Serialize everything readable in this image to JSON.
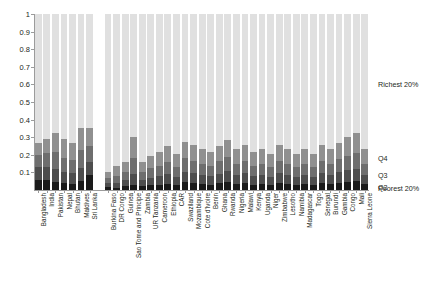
{
  "chart_data": {
    "type": "bar",
    "subtype": "stacked-bar",
    "title": "",
    "xlabel": "",
    "ylabel": "",
    "ylim": [
      0,
      1
    ],
    "ytick_labels": [
      "0",
      "0.1",
      "0.2",
      "0.3",
      "0.4",
      "0.5",
      "0.6",
      "0.7",
      "0.8",
      "0.9",
      "1"
    ],
    "ytick_values": [
      0,
      0.1,
      0.2,
      0.3,
      0.4,
      0.5,
      0.6,
      0.7,
      0.8,
      0.9,
      1
    ],
    "grid": false,
    "legend_position": "right",
    "stack_order_bottom_to_top": [
      "Poorest 20%",
      "Q2",
      "Q3",
      "Q4",
      "Richest 20%"
    ],
    "series": [
      {
        "name": "Poorest 20%",
        "color": "#1a1a1a",
        "values": [
          0.055,
          0.055,
          0.045,
          0.04,
          0.035,
          0.05,
          0.085,
          0.018,
          0.012,
          0.02,
          0.03,
          0.022,
          0.028,
          0.03,
          0.035,
          0.028,
          0.045,
          0.04,
          0.035,
          0.03,
          0.038,
          0.045,
          0.035,
          0.04,
          0.03,
          0.035,
          0.03,
          0.04,
          0.035,
          0.03,
          0.035,
          0.03,
          0.04,
          0.035,
          0.042,
          0.048,
          0.052,
          0.035
        ]
      },
      {
        "name": "Q2",
        "color": "#4d4d4d",
        "values": [
          0.075,
          0.075,
          0.075,
          0.06,
          0.06,
          0.075,
          0.075,
          0.022,
          0.028,
          0.035,
          0.06,
          0.035,
          0.042,
          0.048,
          0.055,
          0.045,
          0.06,
          0.055,
          0.05,
          0.048,
          0.055,
          0.062,
          0.05,
          0.055,
          0.048,
          0.05,
          0.045,
          0.055,
          0.05,
          0.045,
          0.05,
          0.045,
          0.055,
          0.05,
          0.058,
          0.065,
          0.07,
          0.05
        ]
      },
      {
        "name": "Q3",
        "color": "#6e6e6e",
        "values": [
          0.07,
          0.08,
          0.095,
          0.08,
          0.075,
          0.105,
          0.09,
          0.028,
          0.04,
          0.045,
          0.09,
          0.045,
          0.055,
          0.06,
          0.07,
          0.058,
          0.075,
          0.07,
          0.065,
          0.06,
          0.07,
          0.078,
          0.065,
          0.07,
          0.06,
          0.065,
          0.058,
          0.07,
          0.065,
          0.058,
          0.065,
          0.058,
          0.07,
          0.065,
          0.075,
          0.082,
          0.088,
          0.065
        ]
      },
      {
        "name": "Q4",
        "color": "#909090",
        "values": [
          0.07,
          0.08,
          0.11,
          0.11,
          0.095,
          0.125,
          0.105,
          0.035,
          0.055,
          0.058,
          0.12,
          0.058,
          0.07,
          0.078,
          0.09,
          0.072,
          0.095,
          0.09,
          0.082,
          0.078,
          0.09,
          0.1,
          0.082,
          0.09,
          0.078,
          0.082,
          0.072,
          0.09,
          0.082,
          0.072,
          0.082,
          0.072,
          0.09,
          0.082,
          0.095,
          0.105,
          0.112,
          0.082
        ]
      },
      {
        "name": "Richest 20%",
        "color": "#e0e0e0",
        "values": [
          0.73,
          0.71,
          0.675,
          0.71,
          0.735,
          0.645,
          0.645,
          0.897,
          0.865,
          0.842,
          0.7,
          0.84,
          0.805,
          0.784,
          0.75,
          0.797,
          0.725,
          0.745,
          0.768,
          0.784,
          0.747,
          0.715,
          0.768,
          0.745,
          0.784,
          0.768,
          0.795,
          0.745,
          0.768,
          0.795,
          0.768,
          0.795,
          0.745,
          0.768,
          0.73,
          0.7,
          0.678,
          0.768
        ]
      }
    ],
    "categories": [
      "Bangladesh",
      "India",
      "Pakistan",
      "Nepal",
      "Bhutan",
      "Maldives",
      "Sri Lanka",
      "Burkina Faso",
      "DR Congo",
      "Guinea",
      "Sao Tome and Principe",
      "Zambia",
      "UR Tanzania",
      "Cameroon",
      "Ethiopia",
      "CAR",
      "Swaziland",
      "Mozambique",
      "Cote d'Ivoire",
      "Benin",
      "Ghana",
      "Rwanda",
      "Nigeria",
      "Malawi",
      "Kenya",
      "Uganda",
      "Niger",
      "Zimbabwe",
      "Lesotho",
      "Namibia",
      "Madagascar",
      "Togo",
      "Senegal",
      "Burundi",
      "Gambia",
      "Congo",
      "Mali",
      "Sierra Leone"
    ],
    "group_break_after_index": 6,
    "legend_entries": [
      {
        "label": "Richest 20%",
        "color": "#e0e0e0"
      },
      {
        "label": "Q4",
        "color": "#909090"
      },
      {
        "label": "Q3",
        "color": "#6e6e6e"
      },
      {
        "label": "Q2",
        "color": "#4d4d4d"
      },
      {
        "label": "Poorest 20%",
        "color": "#1a1a1a"
      }
    ]
  }
}
